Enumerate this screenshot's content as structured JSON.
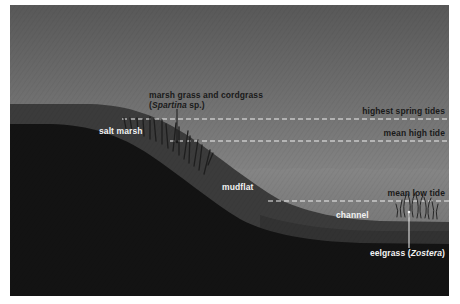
{
  "diagram": {
    "colors": {
      "sky_top": "#5a5a5a",
      "sky_bottom": "#9a9a9a",
      "water": "#7f7f7f",
      "marsh_band": "#3c3c3c",
      "mudflat_band": "#4a4a4a",
      "channel_band": "#383838",
      "substrate": "#141414",
      "tide_line": "#f0f0f0",
      "grass": "#1e1e1e",
      "eelgrass": "#2a2a2a"
    },
    "tide_lines": [
      {
        "id": "highest-spring-tides",
        "label": "highest spring tides",
        "y": 119
      },
      {
        "id": "mean-high-tide",
        "label": "mean high tide",
        "y": 141
      },
      {
        "id": "mean-low-tide",
        "label": "mean low tide",
        "y": 201
      }
    ],
    "zones": [
      {
        "id": "salt-marsh",
        "label": "salt marsh"
      },
      {
        "id": "mudflat",
        "label": "mudflat"
      },
      {
        "id": "channel",
        "label": "channel"
      }
    ],
    "callouts": {
      "marsh_grass": {
        "line1": "marsh grass and cordgrass",
        "line2_open": "(",
        "line2_italic": "Spartina",
        "line2_rest": " sp.)"
      },
      "eelgrass": {
        "prefix": "eelgrass (",
        "italic": "Zostera",
        "suffix": ")"
      }
    }
  }
}
